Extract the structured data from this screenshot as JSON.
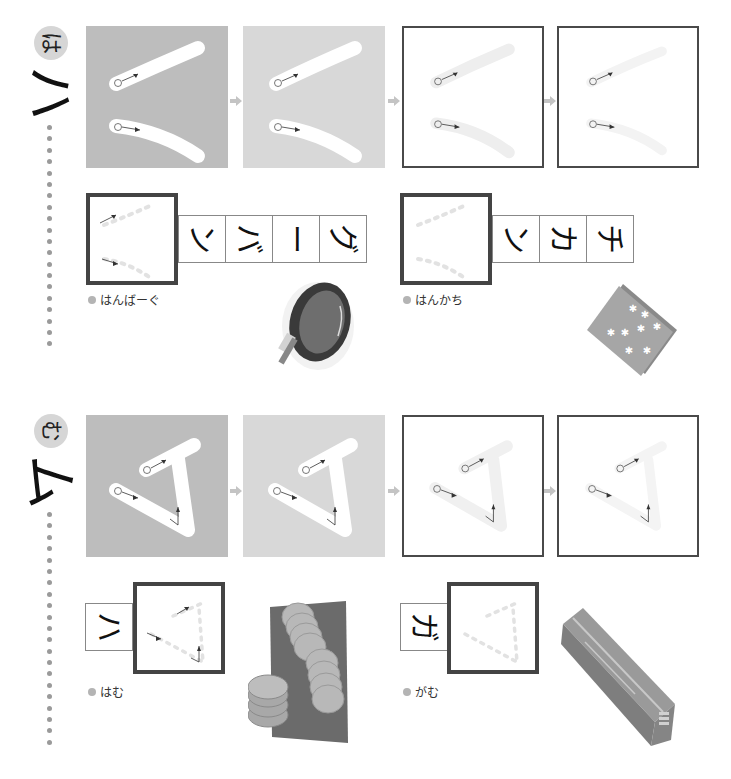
{
  "page": {
    "orientation": "rotated-90",
    "colors": {
      "filled_dark": "#bdbdbd",
      "filled_light": "#d8d8d8",
      "outline": "#4a4a4a",
      "badge": "#d6d6d6",
      "dots": "#9a9a9a",
      "arrow": "#c4c4c4"
    }
  },
  "sections": [
    {
      "id": "ha",
      "badge_hiragana": "は",
      "big_katakana": "ハ",
      "stroke_steps": [
        {
          "style": "filled-dark",
          "stroke_numbers": [
            "①",
            "②"
          ]
        },
        {
          "style": "filled-light",
          "stroke_numbers": [
            "①",
            "②"
          ]
        },
        {
          "style": "outlined",
          "stroke_numbers": [
            "①",
            "②"
          ]
        },
        {
          "style": "outlined",
          "stroke_numbers": [
            "①",
            "②"
          ]
        }
      ],
      "words": [
        {
          "label": "はんばーぐ",
          "practice_kana": "ハ",
          "cells": [
            "ン",
            "バ",
            "ー",
            "グ"
          ],
          "illustration": "hamburger-icon"
        },
        {
          "label": "はんかち",
          "practice_kana": "ハ",
          "cells": [
            "ン",
            "カ",
            "チ"
          ],
          "illustration": "handkerchief-icon"
        }
      ]
    },
    {
      "id": "mu",
      "badge_hiragana": "む",
      "big_katakana": "ム",
      "stroke_steps": [
        {
          "style": "filled-dark",
          "stroke_numbers": [
            "①",
            "②"
          ]
        },
        {
          "style": "filled-light",
          "stroke_numbers": [
            "①",
            "②"
          ]
        },
        {
          "style": "outlined",
          "stroke_numbers": [
            "①",
            "②"
          ]
        },
        {
          "style": "outlined",
          "stroke_numbers": [
            "①",
            "②"
          ]
        }
      ],
      "words": [
        {
          "label": "はむ",
          "practice_kana": "ム",
          "cells": [
            "ハ"
          ],
          "illustration": "ham-icon"
        },
        {
          "label": "がむ",
          "practice_kana": "ム",
          "cells": [
            "ガ"
          ],
          "illustration": "gum-icon"
        }
      ]
    }
  ]
}
